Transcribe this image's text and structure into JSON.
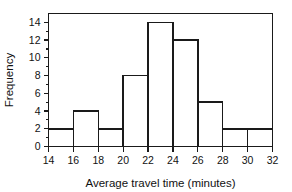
{
  "chart_data": {
    "type": "bar",
    "title": "",
    "subtitle": "",
    "xlabel": "Average travel time (minutes)",
    "ylabel": "Frequency",
    "bin_edges": [
      14,
      16,
      18,
      20,
      22,
      24,
      26,
      28,
      30,
      32
    ],
    "categories": [
      "14-16",
      "16-18",
      "18-20",
      "20-22",
      "22-24",
      "24-26",
      "26-28",
      "28-30",
      "30-32"
    ],
    "values": [
      2,
      4,
      2,
      8,
      14,
      12,
      5,
      2,
      2
    ],
    "bin_width": 2,
    "xlim": [
      14,
      32
    ],
    "ylim": [
      0,
      15
    ],
    "x_ticks": [
      14,
      16,
      18,
      20,
      22,
      24,
      26,
      28,
      30,
      32
    ],
    "x_tick_labels": [
      "14",
      "16",
      "18",
      "20",
      "22",
      "24",
      "26",
      "28",
      "30",
      "32"
    ],
    "y_ticks": [
      0,
      2,
      4,
      6,
      8,
      10,
      12,
      14
    ],
    "y_tick_labels": [
      "0",
      "2",
      "4",
      "6",
      "8",
      "10",
      "12",
      "14"
    ],
    "y_minor_ticks": [
      1,
      3,
      5,
      7,
      9,
      11,
      13
    ],
    "grid": false,
    "legend": false,
    "legend_position": "none",
    "bar_fill": "#ffffff",
    "bar_stroke": "#1a1a1a",
    "axis_color": "#1a1a1a",
    "background": "#ffffff"
  }
}
